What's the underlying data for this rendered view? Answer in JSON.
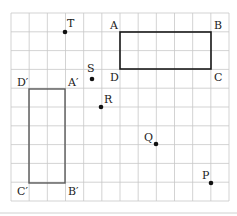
{
  "diagram": {
    "grid": {
      "columns": 12,
      "rows": 10,
      "line_color": "#c8c8c8"
    },
    "rectangles": [
      {
        "id": "ABCD",
        "vertices": [
          "A",
          "B",
          "C",
          "D"
        ],
        "color": "#1a1a1a"
      },
      {
        "id": "A'B'C'D'",
        "vertices": [
          "A′",
          "B′",
          "C′",
          "D′"
        ],
        "color": "#5a5a5a"
      }
    ],
    "vertex_labels": {
      "A": "A",
      "B": "B",
      "C": "C",
      "D": "D",
      "A_prime": "A′",
      "B_prime": "B′",
      "C_prime": "C′",
      "D_prime": "D′"
    },
    "points": [
      {
        "name": "T",
        "label": "T"
      },
      {
        "name": "S",
        "label": "S"
      },
      {
        "name": "R",
        "label": "R"
      },
      {
        "name": "Q",
        "label": "Q"
      },
      {
        "name": "P",
        "label": "P"
      }
    ]
  }
}
